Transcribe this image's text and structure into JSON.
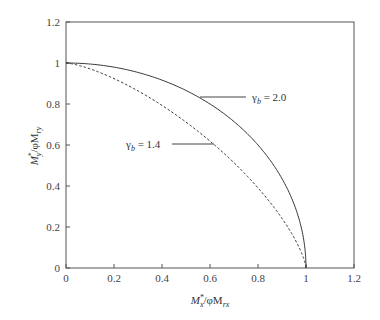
{
  "chart_data": {
    "type": "line",
    "title": "",
    "xlabel": "M*x/φMrx",
    "ylabel": "M*y/φMry",
    "xlim": [
      0,
      1.2
    ],
    "ylim": [
      0,
      1.2
    ],
    "xticks": [
      "0",
      "0.2",
      "0.4",
      "0.6",
      "0.8",
      "1",
      "1.2"
    ],
    "yticks": [
      "0",
      "0.2",
      "0.4",
      "0.6",
      "0.8",
      "1",
      "1.2"
    ],
    "grid": false,
    "legend": "none (inline annotations)",
    "series": [
      {
        "name": "γb = 2.0",
        "style": "solid",
        "x": [
          0,
          0.1,
          0.2,
          0.3,
          0.4,
          0.5,
          0.6,
          0.7,
          0.8,
          0.9,
          0.95,
          1.0
        ],
        "y": [
          1.0,
          0.995,
          0.98,
          0.954,
          0.917,
          0.866,
          0.8,
          0.714,
          0.6,
          0.436,
          0.312,
          0
        ]
      },
      {
        "name": "γb = 1.4",
        "style": "dashed",
        "x": [
          0,
          0.1,
          0.2,
          0.3,
          0.4,
          0.5,
          0.6,
          0.7,
          0.8,
          0.9,
          0.95,
          1.0
        ],
        "y": [
          1.0,
          0.975,
          0.933,
          0.879,
          0.812,
          0.733,
          0.64,
          0.53,
          0.4,
          0.24,
          0.144,
          0
        ]
      }
    ],
    "annotations": [
      {
        "text": "γb = 2.0",
        "points_to": "solid curve",
        "label_x": 0.82,
        "label_y": 0.835
      },
      {
        "text": "γb = 1.4",
        "points_to": "dashed curve",
        "label_x": 0.2,
        "label_y": 0.6
      }
    ]
  },
  "axes": {
    "xlabel_main": "M",
    "xlabel_sup": "*",
    "xlabel_sub": "x",
    "xlabel_rest": "/φM",
    "xlabel_sub2": "rx",
    "ylabel_main": "M",
    "ylabel_sup": "*",
    "ylabel_sub": "y",
    "ylabel_rest": "/φM",
    "ylabel_sub2": "ry"
  },
  "annotations": {
    "a1_gamma": "γ",
    "a1_sub": "b",
    "a1_val": " = 2.0",
    "a2_gamma": "γ",
    "a2_sub": "b",
    "a2_val": " = 1.4"
  }
}
